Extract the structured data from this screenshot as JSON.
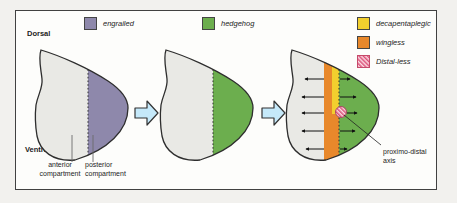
{
  "colors": {
    "disc_fill": "#e9e9e5",
    "engrailed": "#8e88ab",
    "hedgehog": "#6cae4e",
    "decapentaplegic": "#f2cf2e",
    "wingless": "#e8882b",
    "distal_less_bg": "#f9dde3",
    "distal_less_stripe": "#dd5079",
    "flow_arrow_fill": "#c5e9fa"
  },
  "legend": {
    "engrailed": "engrailed",
    "hedgehog": "hedgehog",
    "decapentaplegic": "decapentaplegic",
    "wingless": "wingless",
    "distal_less": "Distal-less"
  },
  "labels": {
    "dorsal": "Dorsal",
    "ventral": "Ventral",
    "anterior_compartment": "anterior compartment",
    "posterior_compartment": "posterior compartment",
    "proximo_distal_axis": "proximo-distal axis"
  }
}
